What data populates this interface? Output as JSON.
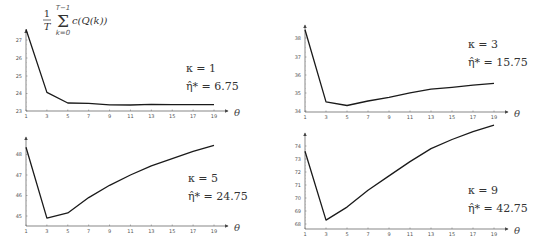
{
  "figure": {
    "y_label_formula": {
      "fraction_num": "1",
      "fraction_den": "T",
      "sum_upper": "T−1",
      "sum_lower": "k=0",
      "body": "c(Q(k))"
    },
    "x_label": "θ"
  },
  "chart_data": [
    {
      "type": "line",
      "title": "",
      "annotation": {
        "kappa": "κ = 1",
        "eta": "η̂* = 6.75"
      },
      "xlabel": "θ",
      "ylabel": "(1/T) Σ_{k=0}^{T−1} c(Q(k))",
      "x": [
        1,
        3,
        5,
        7,
        9,
        11,
        13,
        15,
        17,
        19
      ],
      "xticks": [
        "1",
        "3",
        "5",
        "7",
        "9",
        "11",
        "13",
        "15",
        "17",
        "19"
      ],
      "yticks": [
        "23",
        "24",
        "25",
        "26",
        "27"
      ],
      "ylim": [
        23,
        27.8
      ],
      "series": [
        {
          "name": "average cost",
          "values": [
            27.6,
            24.05,
            23.45,
            23.43,
            23.35,
            23.34,
            23.37,
            23.36,
            23.36,
            23.36
          ]
        }
      ]
    },
    {
      "type": "line",
      "title": "",
      "annotation": {
        "kappa": "κ = 3",
        "eta": "η̂* = 15.75"
      },
      "xlabel": "θ",
      "ylabel": "",
      "x": [
        1,
        3,
        5,
        7,
        9,
        11,
        13,
        15,
        17,
        19
      ],
      "xticks": [
        "1",
        "3",
        "5",
        "7",
        "9",
        "11",
        "13",
        "15",
        "17",
        "19"
      ],
      "yticks": [
        "34",
        "35",
        "36",
        "37",
        "38"
      ],
      "ylim": [
        34,
        38.8
      ],
      "series": [
        {
          "name": "average cost",
          "values": [
            38.45,
            34.5,
            34.3,
            34.55,
            34.75,
            35.0,
            35.2,
            35.3,
            35.42,
            35.52
          ]
        }
      ]
    },
    {
      "type": "line",
      "title": "",
      "annotation": {
        "kappa": "κ = 5",
        "eta": "η̂* = 24.75"
      },
      "xlabel": "θ",
      "ylabel": "",
      "x": [
        1,
        3,
        5,
        7,
        9,
        11,
        13,
        15,
        17,
        19
      ],
      "xticks": [
        "1",
        "3",
        "5",
        "7",
        "9",
        "11",
        "13",
        "15",
        "17",
        "19"
      ],
      "yticks": [
        "45",
        "46",
        "47",
        "48"
      ],
      "ylim": [
        44.5,
        48.7
      ],
      "series": [
        {
          "name": "average cost",
          "values": [
            48.35,
            44.9,
            45.15,
            45.9,
            46.5,
            47.0,
            47.45,
            47.8,
            48.15,
            48.45
          ]
        }
      ]
    },
    {
      "type": "line",
      "title": "",
      "annotation": {
        "kappa": "κ = 9",
        "eta": "η̂* = 42.75"
      },
      "xlabel": "θ",
      "ylabel": "",
      "x": [
        1,
        3,
        5,
        7,
        9,
        11,
        13,
        15,
        17,
        19
      ],
      "xticks": [
        "1",
        "3",
        "5",
        "7",
        "9",
        "11",
        "13",
        "15",
        "17",
        "19"
      ],
      "yticks": [
        "68",
        "69",
        "70",
        "71",
        "72",
        "73",
        "74"
      ],
      "ylim": [
        67.7,
        75.0
      ],
      "series": [
        {
          "name": "average cost",
          "values": [
            73.6,
            68.3,
            69.3,
            70.6,
            71.7,
            72.8,
            73.8,
            74.5,
            75.1,
            75.6
          ]
        }
      ]
    }
  ],
  "panels_layout": [
    {
      "x0": 26,
      "x1": 214,
      "ybase": 111,
      "ytop": 30,
      "axis_end": 228
    },
    {
      "x0": 305,
      "x1": 494,
      "ybase": 112,
      "ytop": 25,
      "axis_end": 508
    },
    {
      "x0": 26,
      "x1": 214,
      "ybase": 226,
      "ytop": 137,
      "axis_end": 228
    },
    {
      "x0": 305,
      "x1": 494,
      "ybase": 229,
      "ytop": 133,
      "axis_end": 508
    }
  ],
  "tick_pixels": [
    {
      "yticks_px": [
        111,
        93.5,
        76,
        58,
        40
      ]
    },
    {
      "yticks_px": [
        111,
        93,
        75,
        57,
        38
      ]
    },
    {
      "yticks_px": [
        216,
        195.5,
        175,
        154.5
      ]
    },
    {
      "yticks_px": [
        224,
        211,
        198,
        185,
        172,
        159,
        146
      ]
    }
  ],
  "annotation_pos": [
    {
      "x": 438,
      "y1": 72,
      "y2": 90,
      "rel": "tl"
    },
    {
      "x": 472,
      "y1": 48,
      "y2": 66
    },
    {
      "x": 192,
      "y1": 182,
      "y2": 200
    },
    {
      "x": 472,
      "y1": 194,
      "y2": 212
    }
  ]
}
